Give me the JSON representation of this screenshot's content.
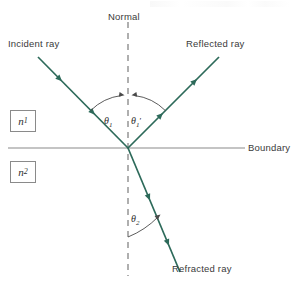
{
  "figure": {
    "title_visible": false,
    "width": 298,
    "height": 287,
    "background_color": "#ffffff"
  },
  "colors": {
    "ray": "#2d6a5a",
    "boundary_line": "#8a8a8a",
    "normal_line": "#6e6e6e",
    "arc": "#4a4a4a",
    "text": "#3a3a3a",
    "box_border": "#8a8a8a"
  },
  "labels": {
    "normal": "Normal",
    "incident_ray": "Incident ray",
    "reflected_ray": "Reflected ray",
    "refracted_ray": "Refracted ray",
    "boundary": "Boundary"
  },
  "angles": {
    "theta1": {
      "symbol": "θ",
      "subscript": "1",
      "prime": ""
    },
    "theta1_prime": {
      "symbol": "θ",
      "subscript": "1",
      "prime": "′"
    },
    "theta2": {
      "symbol": "θ",
      "subscript": "2",
      "prime": ""
    }
  },
  "media": {
    "upper": {
      "symbol": "n",
      "subscript": "1"
    },
    "lower": {
      "symbol": "n",
      "subscript": "2"
    }
  },
  "geometry": {
    "intersection": {
      "x": 128,
      "y": 148
    },
    "boundary_line": {
      "x1": 8,
      "y1": 148,
      "x2": 245,
      "y2": 148
    },
    "normal_line": {
      "x1": 128,
      "y1": 22,
      "x2": 128,
      "y2": 276,
      "style": "dashed"
    },
    "incident_ray": {
      "x1": 38,
      "y1": 57,
      "x2": 128,
      "y2": 148,
      "direction": "toward-intersection"
    },
    "reflected_ray": {
      "x1": 128,
      "y1": 148,
      "x2": 219,
      "y2": 57,
      "direction": "away-from-intersection"
    },
    "refracted_ray": {
      "x1": 128,
      "y1": 148,
      "x2": 180,
      "y2": 272,
      "direction": "away-from-intersection"
    }
  }
}
